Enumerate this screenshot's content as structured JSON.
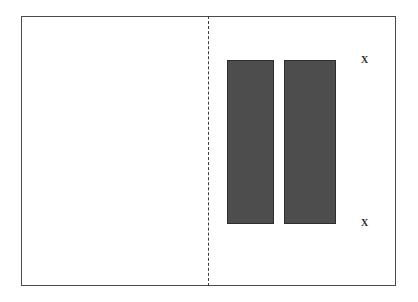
{
  "figure": {
    "type": "technical-line-drawing",
    "background_color": "#ffffff",
    "frame": {
      "name": "outer-frame",
      "stroke_color": "#4a4a4a",
      "stroke_width_px": 1,
      "x": 21,
      "y": 16,
      "width": 375,
      "height": 270
    },
    "centerline": {
      "name": "vertical-dashed-centerline",
      "orientation": "vertical",
      "style": "dashed",
      "stroke_color": "#3b3b3b",
      "x": 208,
      "y_start": 16,
      "y_end": 286
    },
    "hatched_bars": [
      {
        "id": "left",
        "x": 227,
        "y": 60,
        "width": 47,
        "height": 164,
        "fill_pattern": "horizontal-dash-hatch",
        "fill_color": "#fdfdfd",
        "hatch_color": "#4d4d4d",
        "stroke_color": "#2e2e2e"
      },
      {
        "id": "right",
        "x": 284,
        "y": 60,
        "width": 52,
        "height": 164,
        "fill_pattern": "horizontal-dash-hatch",
        "fill_color": "#fdfdfd",
        "hatch_color": "#4d4d4d",
        "stroke_color": "#2e2e2e"
      }
    ],
    "labels": {
      "x_top": "X",
      "x_bottom": "X"
    }
  }
}
